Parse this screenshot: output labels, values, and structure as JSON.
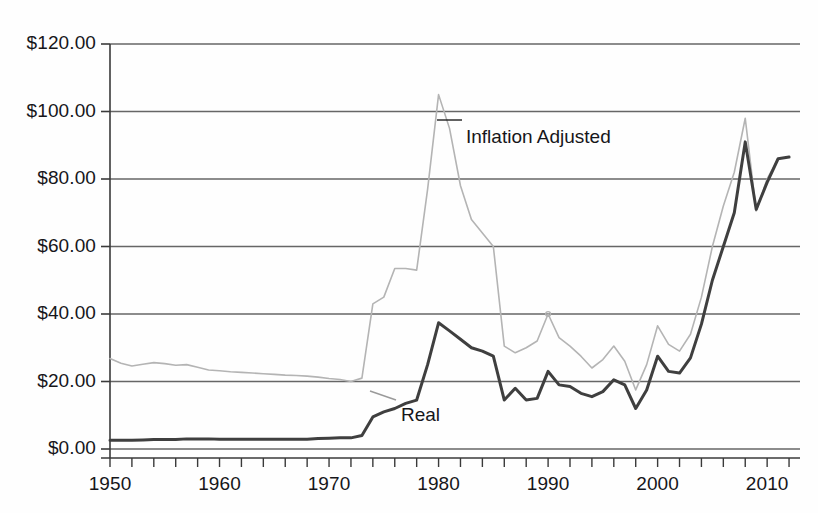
{
  "figure": {
    "title": "",
    "background_color": "#fefefe",
    "width": 818,
    "height": 513
  },
  "axes": {
    "y_labels": [
      "$120.00",
      "$100.00",
      "$80.00",
      "$60.00",
      "$40.00",
      "$20.00",
      "$0.00"
    ],
    "x_labels": [
      "1950",
      "1960",
      "1970",
      "1980",
      "1990",
      "2000",
      "2010"
    ],
    "gridline_color": "#666666",
    "axis_color": "#3a3a3a"
  },
  "annotations": [
    {
      "name": "inflation-adjusted-label",
      "text": "Inflation Adjusted",
      "x": 466,
      "y": 126
    },
    {
      "name": "real-label",
      "text": "Real",
      "x": 401,
      "y": 404
    }
  ],
  "chart_data": {
    "type": "line",
    "title": "",
    "xlabel": "",
    "ylabel": "",
    "xlim": [
      1950,
      2013
    ],
    "ylim": [
      0,
      120
    ],
    "grid": true,
    "legend": "annotations-inline",
    "x": [
      1950,
      1951,
      1952,
      1953,
      1954,
      1955,
      1956,
      1957,
      1958,
      1959,
      1960,
      1961,
      1962,
      1963,
      1964,
      1965,
      1966,
      1967,
      1968,
      1969,
      1970,
      1971,
      1972,
      1973,
      1974,
      1975,
      1976,
      1977,
      1978,
      1979,
      1980,
      1981,
      1982,
      1983,
      1984,
      1985,
      1986,
      1987,
      1988,
      1989,
      1990,
      1991,
      1992,
      1993,
      1994,
      1995,
      1996,
      1997,
      1998,
      1999,
      2000,
      2001,
      2002,
      2003,
      2004,
      2005,
      2006,
      2007,
      2008,
      2009,
      2010,
      2011,
      2012
    ],
    "series": [
      {
        "name": "Inflation Adjusted",
        "color": "#b4b4b4",
        "width": 1.6,
        "values": [
          26.8,
          25.4,
          24.6,
          25.1,
          25.6,
          25.3,
          24.8,
          25.0,
          24.2,
          23.4,
          23.2,
          22.9,
          22.7,
          22.5,
          22.3,
          22.1,
          21.9,
          21.8,
          21.6,
          21.3,
          20.9,
          20.6,
          20.0,
          21.0,
          43.0,
          45.0,
          53.5,
          53.5,
          53.0,
          77.0,
          105.0,
          95.0,
          78.0,
          68.0,
          64.0,
          60.0,
          30.5,
          28.5,
          30.0,
          32.0,
          40.0,
          33.0,
          30.5,
          27.5,
          24.0,
          26.5,
          30.5,
          26.0,
          17.5,
          25.0,
          36.5,
          31.0,
          29.0,
          34.0,
          45.0,
          60.0,
          72.0,
          82.0,
          98.0,
          70.5,
          80.0,
          86.0,
          86.5
        ]
      },
      {
        "name": "Real",
        "color": "#3f3f3f",
        "width": 3.0,
        "values": [
          2.6,
          2.6,
          2.6,
          2.7,
          2.8,
          2.8,
          2.8,
          3.0,
          3.0,
          3.0,
          2.9,
          2.9,
          2.9,
          2.9,
          2.9,
          2.9,
          2.9,
          2.9,
          2.9,
          3.1,
          3.2,
          3.3,
          3.3,
          4.0,
          9.5,
          11.0,
          12.0,
          13.5,
          14.5,
          25.0,
          37.4,
          35.0,
          32.5,
          30.0,
          29.0,
          27.5,
          14.5,
          18.0,
          14.5,
          15.0,
          23.0,
          19.0,
          18.5,
          16.5,
          15.5,
          17.0,
          20.5,
          19.0,
          12.0,
          17.5,
          27.5,
          23.0,
          22.5,
          27.0,
          37.0,
          50.0,
          60.0,
          70.0,
          91.0,
          71.0,
          79.0,
          86.0,
          86.5
        ]
      }
    ]
  }
}
